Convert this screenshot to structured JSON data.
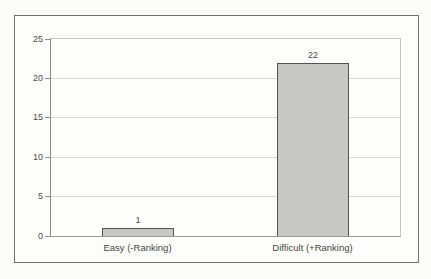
{
  "chart_data": {
    "type": "bar",
    "categories": [
      "Easy (-Ranking)",
      "Difficult (+Ranking)"
    ],
    "values": [
      1,
      22
    ],
    "value_labels": [
      "1",
      "22"
    ],
    "title": "",
    "xlabel": "",
    "ylabel": "",
    "ylim": [
      0,
      25
    ],
    "yticks": [
      0,
      5,
      10,
      15,
      20,
      25
    ],
    "grid": "horizontal",
    "legend_position": "none",
    "bar_fill": "#c7c7c5",
    "bar_border": "#525252",
    "frame_border": "#707070",
    "gridline_color": "#d8d8d6",
    "background": "#fcfcfa",
    "text_color": "#4c4c4c"
  }
}
